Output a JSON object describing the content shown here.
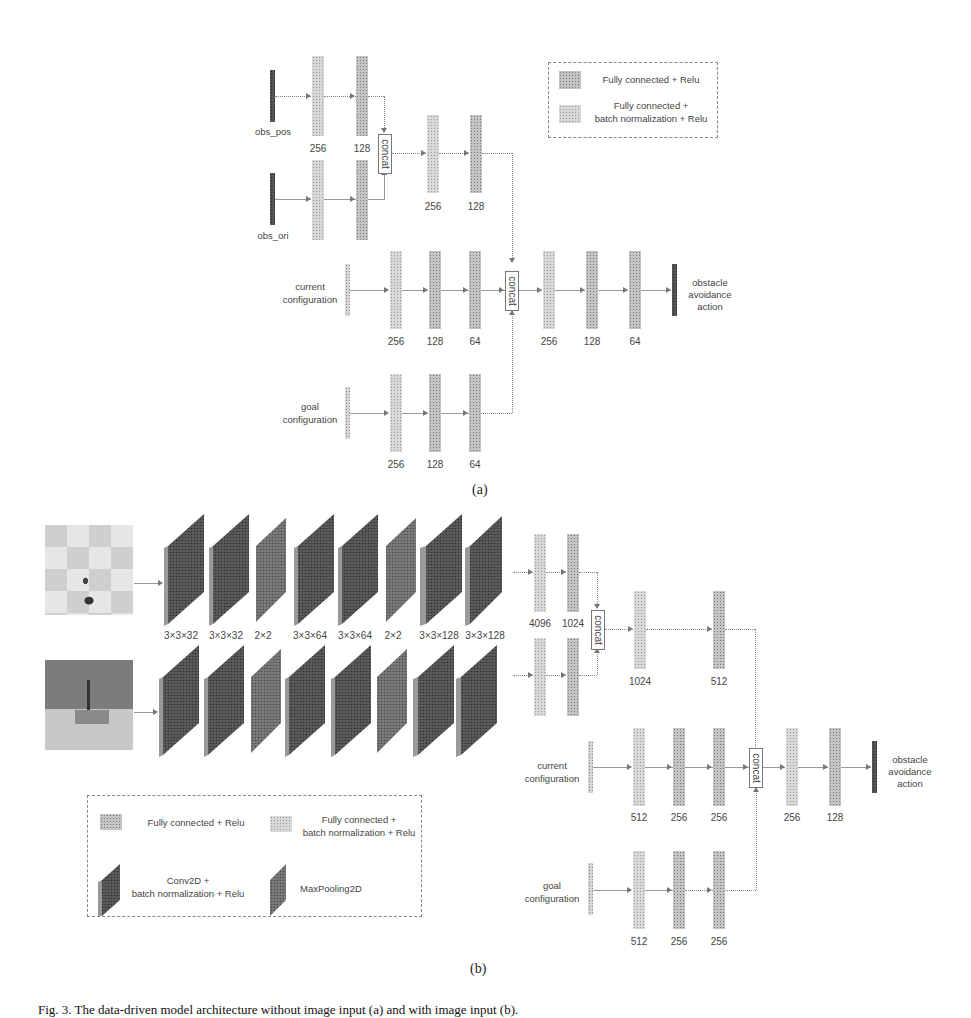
{
  "part_a": {
    "subcaption": "(a)",
    "legend": {
      "fc_relu": "Fully connected + Relu",
      "fc_bn_relu_line1": "Fully connected +",
      "fc_bn_relu_line2": "batch normalization + Relu"
    },
    "inputs": {
      "obs_pos": "obs_pos",
      "obs_ori": "obs_ori",
      "current_config_line1": "current",
      "current_config_line2": "configuration",
      "goal_config_line1": "goal",
      "goal_config_line2": "configuration"
    },
    "obs_branch_units": [
      "256",
      "128"
    ],
    "merged_obs_units": [
      "256",
      "128"
    ],
    "current_branch_units": [
      "256",
      "128",
      "64"
    ],
    "goal_branch_units": [
      "256",
      "128",
      "64"
    ],
    "head_units": [
      "256",
      "128",
      "64"
    ],
    "concat_label": "concat",
    "output_line1": "obstacle",
    "output_line2": "avoidance",
    "output_line3": "action"
  },
  "part_b": {
    "subcaption": "(b)",
    "conv_layers": [
      "3×3×32",
      "3×3×32",
      "2×2",
      "3×3×64",
      "3×3×64",
      "2×2",
      "3×3×128",
      "3×3×128"
    ],
    "image_branch_units": [
      "4096",
      "1024"
    ],
    "merged_image_units": [
      "1024",
      "512"
    ],
    "current_branch_units": [
      "512",
      "256",
      "256"
    ],
    "goal_branch_units": [
      "512",
      "256",
      "256"
    ],
    "head_units": [
      "256",
      "128"
    ],
    "concat_label": "concat",
    "inputs": {
      "current_config_line1": "current",
      "current_config_line2": "configuration",
      "goal_config_line1": "goal",
      "goal_config_line2": "configuration"
    },
    "output_line1": "obstacle",
    "output_line2": "avoidance",
    "output_line3": "action",
    "legend": {
      "fc_relu": "Fully connected + Relu",
      "fc_bn_relu_line1": "Fully connected +",
      "fc_bn_relu_line2": "batch normalization + Relu",
      "conv_line1": "Conv2D +",
      "conv_line2": "batch normalization + Relu",
      "maxpool": "MaxPooling2D"
    }
  },
  "figure_caption": "Fig. 3.  The data-driven model architecture without image input (a) and with image input (b)."
}
